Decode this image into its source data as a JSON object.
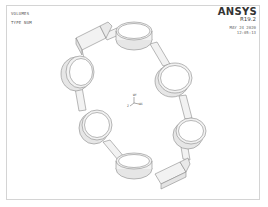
{
  "viewport": {
    "plot_title": "VOLUMES",
    "numbering_label": "TYPE NUM",
    "product": "ANSYS",
    "version": "R19.2",
    "date": "MAY 24 2020",
    "time": "12:05:13",
    "frame_color": "#d4d4d4",
    "line_color": "#8a8a8a",
    "fill_color": "#f2f2f2"
  },
  "triad": {
    "y_label": "WY",
    "x_label": "WX",
    "z_label": "Z"
  },
  "model": {
    "description": "chain of six ring volumes linked by bars",
    "ring_count": 6
  }
}
